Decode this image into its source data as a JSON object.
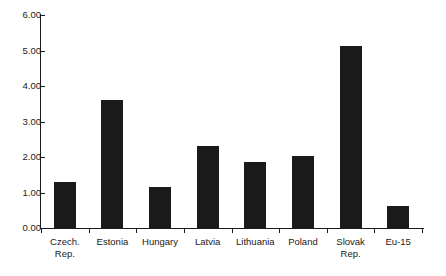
{
  "chart_data": {
    "type": "bar",
    "title": "",
    "subtitle": "",
    "xlabel": "",
    "ylabel": "",
    "categories": [
      "Czech.\nRep.",
      "Estonia",
      "Hungary",
      "Latvia",
      "Lithuania",
      "Poland",
      "Slovak\nRep.",
      "Eu-15"
    ],
    "values": [
      1.3,
      3.6,
      1.16,
      2.31,
      1.86,
      2.03,
      5.13,
      0.62
    ],
    "ylim": [
      0,
      6
    ],
    "ytick_labels": [
      "6.00",
      "5.00",
      "4.00",
      "3.00",
      "2.00",
      "1.00",
      "0.00"
    ],
    "ytick_values": [
      6,
      5,
      4,
      3,
      2,
      1,
      0
    ],
    "grid": false,
    "legend": null,
    "series": [
      {
        "name": "",
        "values": [
          1.3,
          3.6,
          1.16,
          2.31,
          1.86,
          2.03,
          5.13,
          0.62
        ]
      }
    ],
    "bar_color": "#1a1a1a",
    "axis_color": "#1a1a1a",
    "background_color": "#ffffff"
  }
}
